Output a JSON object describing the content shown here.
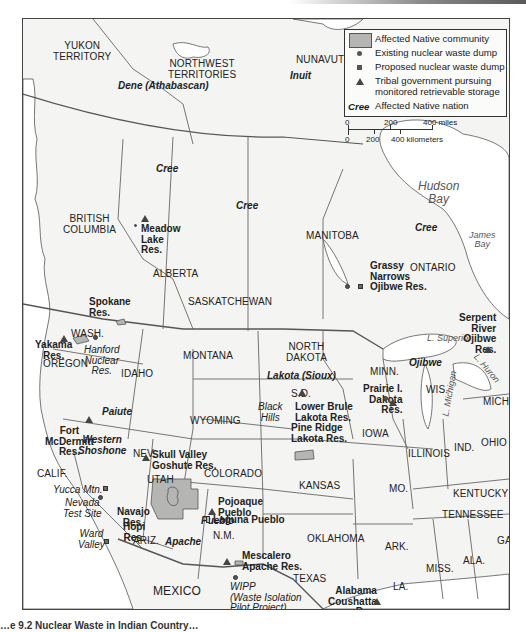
{
  "figure": {
    "caption_partial": "…e 9.2 Nuclear Waste in Indian Country…"
  },
  "legend": {
    "community_label": "Affected Native community",
    "existing_dump_label": "Existing nuclear waste dump",
    "proposed_dump_label": "Proposed nuclear waste dump",
    "tribal_gov_label_line1": "Tribal government pursuing",
    "tribal_gov_label_line2": "monitored retrievable storage",
    "nation_sample": "Cree",
    "nation_label": "Affected Native nation"
  },
  "scale": {
    "miles_0": "0",
    "miles_200": "200",
    "miles_400": "400 miles",
    "km_0": "0",
    "km_200": "200",
    "km_400": "400 kilometers"
  },
  "colors": {
    "community_fill": "#b5b5b3",
    "land": "#f4f4f2",
    "water": "#ffffff",
    "border": "#555555"
  },
  "regions": {
    "yukon": "YUKON\nTERRITORY",
    "nwt": "NORTHWEST\nTERRITORIES",
    "nunavut": "NUNAVUT",
    "bc": "BRITISH\nCOLUMBIA",
    "alberta": "ALBERTA",
    "saskatchewan": "SASKATCHEWAN",
    "manitoba": "MANITOBA",
    "ontario": "ONTARIO",
    "wash": "WASH.",
    "oregon": "OREGON",
    "idaho": "IDAHO",
    "montana": "MONTANA",
    "north_dakota": "NORTH\nDAKOTA",
    "sd": "S.D.",
    "minn": "MINN.",
    "wis": "WIS.",
    "mich": "MICH.",
    "wyoming": "WYOMING",
    "iowa": "IOWA",
    "illinois": "ILLINOIS",
    "ind": "IND.",
    "ohio": "OHIO",
    "nev": "NEV.",
    "calif": "CALIF.",
    "utah": "UTAH",
    "colorado": "COLORADO",
    "kansas": "KANSAS",
    "mo": "MO.",
    "kentucky": "KENTUCKY",
    "tennessee": "TENNESSEE",
    "ariz": "ARIZ.",
    "nm": "N.M.",
    "oklahoma": "OKLAHOMA",
    "ark": "ARK.",
    "texas": "TEXAS",
    "la": "LA.",
    "miss": "MISS.",
    "ala": "ALA.",
    "ga": "GA.",
    "mexico": "MEXICO"
  },
  "water": {
    "hudson_bay": "Hudson\nBay",
    "james_bay": "James\nBay",
    "superior": "L. Superior",
    "michigan": "L. Michigan",
    "huron": "L. Huron"
  },
  "places": {
    "black_hills": "Black\nHills"
  },
  "nations": {
    "dene": "Dene (Athabascan)",
    "inuit": "Inuit",
    "cree_nw": "Cree",
    "cree_sask": "Cree",
    "cree_ont": "Cree",
    "ojibwe": "Ojibwe",
    "lakota": "Lakota (Sioux)",
    "paiute": "Paiute",
    "western_shoshone": "Western\nShoshone",
    "pueblo": "Pueblo",
    "apache": "Apache"
  },
  "reservations": {
    "meadow_lake": "Meadow\nLake\nRes.",
    "grassy_narrows": "Grassy\nNarrows\nOjibwe Res.",
    "serpent_river": "Serpent\nRiver\nOjibwe\nRes.",
    "spokane": "Spokane\nRes.",
    "yakama": "Yakama\nRes.",
    "lower_brule": "Lower Brule\nLakota Res.",
    "pine_ridge": "Pine Ridge\nLakota Res.",
    "prairie_island": "Prairie I.\nDakota\nRes.",
    "fort_mcdermitt": "Fort\nMcDermitt\nRes.",
    "skull_valley": "Skull Valley\nGoshute Res.",
    "navajo": "Navajo\nRes.",
    "hopi": "Hopi\nRes.",
    "pojoaque": "Pojoaque\nPueblo",
    "laguna": "Laguna Pueblo",
    "mescalero": "Mescalero\nApache Res.",
    "alabama_coushatta": "Alabama\nCoushatta\nRes."
  },
  "sites": {
    "hanford": "Hanford\nNuclear\nRes.",
    "yucca": "Yucca Mtn.",
    "nevada_test": "Nevada\nTest Site",
    "ward_valley": "Ward\nValley",
    "wipp": "WIPP\n(Waste Isolation\nPilot Project)\nCarlsbad, N.M."
  }
}
